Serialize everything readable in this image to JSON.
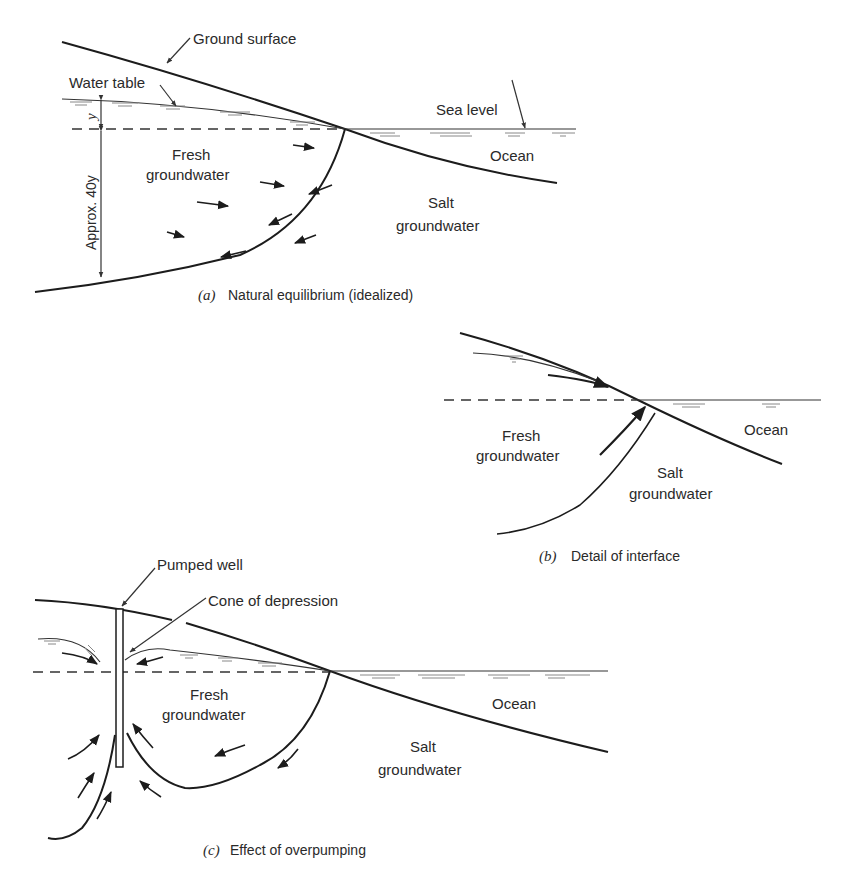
{
  "panels": {
    "a": {
      "caption_letter": "(a)",
      "caption_text": "Natural equilibrium (idealized)",
      "labels": {
        "ground_surface": "Ground surface",
        "water_table": "Water table",
        "sea_level": "Sea level",
        "ocean": "Ocean",
        "fresh_1": "Fresh",
        "fresh_2": "groundwater",
        "salt_1": "Salt",
        "salt_2": "groundwater",
        "y": "y",
        "approx": "Approx. 40y"
      }
    },
    "b": {
      "caption_letter": "(b)",
      "caption_text": "Detail of interface",
      "labels": {
        "fresh_1": "Fresh",
        "fresh_2": "groundwater",
        "salt_1": "Salt",
        "salt_2": "groundwater",
        "ocean": "Ocean"
      }
    },
    "c": {
      "caption_letter": "(c)",
      "caption_text": "Effect of overpumping",
      "labels": {
        "pumped_well": "Pumped well",
        "cone": "Cone of depression",
        "fresh_1": "Fresh",
        "fresh_2": "groundwater",
        "salt_1": "Salt",
        "salt_2": "groundwater",
        "ocean": "Ocean"
      }
    }
  }
}
